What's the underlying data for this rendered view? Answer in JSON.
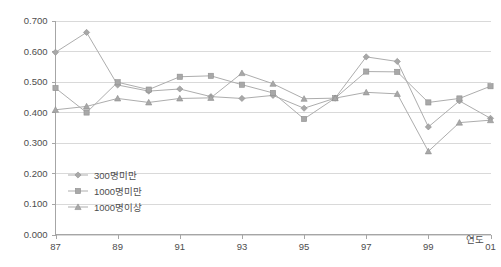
{
  "chart_data": {
    "type": "line",
    "title": "",
    "xlabel": "연도",
    "ylabel": "",
    "ylim": [
      0.0,
      0.7
    ],
    "ytick_values": [
      0.0,
      0.1,
      0.2,
      0.3,
      0.4,
      0.5,
      0.6,
      0.7
    ],
    "ytick_labels": [
      "0.000",
      "0.100",
      "0.200",
      "0.300",
      "0.400",
      "0.500",
      "0.600",
      "0.700"
    ],
    "x": [
      87,
      88,
      89,
      90,
      91,
      92,
      93,
      94,
      95,
      96,
      97,
      98,
      99,
      100,
      101
    ],
    "xtick_positions": [
      87,
      89,
      91,
      93,
      95,
      97,
      99,
      101
    ],
    "xtick_labels": [
      "87",
      "89",
      "91",
      "93",
      "95",
      "97",
      "99",
      "01"
    ],
    "grid": "horizontal",
    "legend_position": "inside-bottom-left",
    "series": [
      {
        "name": "300명미만",
        "marker": "diamond",
        "color": "#a8a8a8",
        "values": [
          0.596,
          0.661,
          0.489,
          0.469,
          0.476,
          0.451,
          0.445,
          0.455,
          0.413,
          0.446,
          0.581,
          0.566,
          0.352,
          0.437,
          0.38
        ]
      },
      {
        "name": "1000명미만",
        "marker": "square",
        "color": "#a8a8a8",
        "values": [
          0.479,
          0.399,
          0.498,
          0.474,
          0.516,
          0.519,
          0.49,
          0.463,
          0.378,
          0.446,
          0.533,
          0.532,
          0.432,
          0.445,
          0.485
        ]
      },
      {
        "name": "1000명이상",
        "marker": "triangle",
        "color": "#a8a8a8",
        "values": [
          0.408,
          0.419,
          0.445,
          0.432,
          0.445,
          0.447,
          0.528,
          0.493,
          0.444,
          0.446,
          0.465,
          0.46,
          0.272,
          0.366,
          0.374
        ]
      }
    ]
  },
  "axis": {
    "x_title": "연도"
  }
}
